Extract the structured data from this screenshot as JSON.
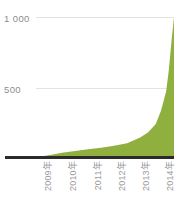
{
  "chart_data": {
    "type": "area",
    "title": "",
    "subtitle": "",
    "xlabel": "",
    "ylabel": "",
    "categories": [
      "2009年",
      "2010年",
      "2011年",
      "2012年",
      "2013年",
      "2014年"
    ],
    "x": [
      2009,
      2010,
      2011,
      2012,
      2013,
      2014
    ],
    "series": [
      {
        "name": "",
        "color": "#8fb03f",
        "values": [
          5,
          30,
          55,
          80,
          140,
          1000
        ]
      }
    ],
    "points": [
      {
        "x": 2009.0,
        "y": 2
      },
      {
        "x": 2009.3,
        "y": 8
      },
      {
        "x": 2009.6,
        "y": 16
      },
      {
        "x": 2010.0,
        "y": 30
      },
      {
        "x": 2010.5,
        "y": 42
      },
      {
        "x": 2011.0,
        "y": 55
      },
      {
        "x": 2011.5,
        "y": 66
      },
      {
        "x": 2012.0,
        "y": 80
      },
      {
        "x": 2012.5,
        "y": 98
      },
      {
        "x": 2013.0,
        "y": 140
      },
      {
        "x": 2013.3,
        "y": 175
      },
      {
        "x": 2013.6,
        "y": 235
      },
      {
        "x": 2013.8,
        "y": 330
      },
      {
        "x": 2014.0,
        "y": 470
      },
      {
        "x": 2014.1,
        "y": 620
      },
      {
        "x": 2014.2,
        "y": 820
      },
      {
        "x": 2014.3,
        "y": 1000
      }
    ],
    "ylim": [
      0,
      1000
    ],
    "yticks": [
      500,
      1000
    ],
    "ytick_labels": [
      "500",
      "1 000"
    ],
    "grid": true,
    "legend": false,
    "legend_position": "none",
    "axis_line_color": "#2b2b2b",
    "grid_color": "#e3e3e3",
    "tick_label_color": "#9a9a9a",
    "background": "#ffffff",
    "area_path": "M 0,139.7 L 2.4,138.9 L 4.9,137.8 L 8.1,136.0 L 12.2,133.8 L 16.3,131.9 L 20.4,130.2 L 24.5,128.8 L 28.6,127.5 L 32.7,126.2 L 36.8,124.9 L 40.8,123.6 L 44.9,122.2 L 49.0,120.6 L 53.1,118.9 L 57.2,117.0 L 61.2,115.0 L 65.3,112.8 L 69.4,110.4 L 73.5,107.8 L 77.6,104.9 L 81.6,101.5 L 85.7,97.6 L 89.8,93.0 L 93.1,88.6 L 96.3,83.5 L 99.6,77.4 L 102.0,72.0 L 104.4,65.8 L 106.9,58.6 L 109.3,50.3 L 111.0,43.6 L 112.6,36.3 L 114.2,28.3 L 115.5,20.9 L 116.6,13.7 L 117.4,7.6 L 118.0,2.6 L 118.3,0.3 L 119.2,0.3 L 119.9,3.5 L 120.9,10.5 L 122.1,21.0 L 123.6,35.0 L 125.4,51.0 L 127.5,68.0 L 130.0,84.0 L 133.0,99.0 L 136.0,112.0 L 138.0,120.0 L 138.0,139.7 Z"
  },
  "yaxis": {
    "label_1000": "1 000",
    "label_500": "500"
  },
  "xaxis": {
    "ticks": [
      {
        "label": "2009年"
      },
      {
        "label": "2010年"
      },
      {
        "label": "2011年"
      },
      {
        "label": "2012年"
      },
      {
        "label": "2013年"
      },
      {
        "label": "2014年"
      }
    ]
  }
}
